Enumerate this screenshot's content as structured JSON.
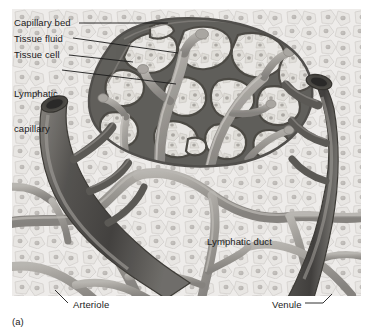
{
  "figure": {
    "caption": "(a)",
    "style": "grayscale anatomical illustration"
  },
  "labels": {
    "capillary_bed": "Capillary bed",
    "tissue_fluid": "Tissue fluid",
    "tissue_cell": "Tissue cell",
    "lymphatic_capillary_line1": "Lymphatic",
    "lymphatic_capillary_line2": "capillary",
    "lymphatic_duct": "Lymphatic duct",
    "arteriole": "Arteriole",
    "venule": "Venule"
  },
  "colors": {
    "background": "#ffffff",
    "tissue_field": "#eceae7",
    "tissue_cell_fill": "#e2e0dc",
    "tissue_cell_outline": "#b9b6b1",
    "nucleus": "#a9a6a1",
    "capillary_dark": "#55534f",
    "capillary_mid": "#6e6c67",
    "vessel_large": "#4a4845",
    "vessel_highlight": "#8d8a85",
    "lymphatic_light": "#a6a39e",
    "lymphatic_duct_gray": "#918e89",
    "leader_line": "#1a1a1a",
    "text": "#1a1a1a"
  },
  "structures": [
    {
      "name": "arteriole",
      "type": "vessel",
      "tone": "dark",
      "position": "left, entering from upper-left with open lumen"
    },
    {
      "name": "venule",
      "type": "vessel",
      "tone": "dark",
      "position": "right, entering from upper-right with open lumen"
    },
    {
      "name": "capillary-bed",
      "type": "network",
      "tone": "dark-mesh",
      "position": "upper-center"
    },
    {
      "name": "lymphatic-capillary",
      "type": "blind-ended tubes",
      "tone": "mid-gray",
      "position": "within capillary bed"
    },
    {
      "name": "lymphatic-duct",
      "type": "branching network",
      "tone": "mid-gray",
      "position": "lower half"
    },
    {
      "name": "tissue-cells",
      "type": "cell field",
      "tone": "pale",
      "position": "background throughout"
    }
  ]
}
